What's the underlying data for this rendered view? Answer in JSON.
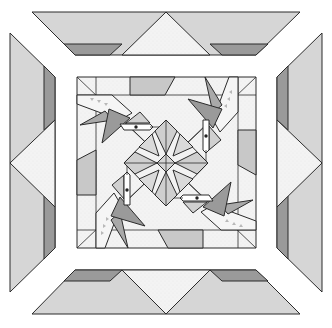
{
  "diagram": {
    "title": "",
    "type": "quilt-block-pattern",
    "canvas": {
      "width": 332,
      "height": 328
    },
    "colors": {
      "background": "#ffffff",
      "light_gray": "#d9d9d9",
      "medium_gray": "#c4c4c4",
      "dark_gray": "#8f8f8f",
      "speckled_white": "#f1f1f1",
      "outline": "#2b2b2b"
    },
    "border_panels": [
      {
        "id": "top",
        "position": "top"
      },
      {
        "id": "right",
        "position": "right"
      },
      {
        "id": "bottom",
        "position": "bottom"
      },
      {
        "id": "left",
        "position": "left"
      }
    ],
    "center_block": {
      "bounds": {
        "x": 77,
        "y": 77,
        "width": 179,
        "height": 171
      },
      "motif": "star-medallion with four pinwheel birds"
    }
  }
}
